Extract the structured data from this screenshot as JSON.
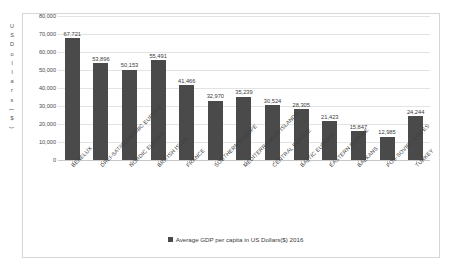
{
  "chart_data": {
    "type": "bar",
    "title": "",
    "xlabel": "",
    "ylabel": "US Dollars($)",
    "ylim": [
      0,
      80000
    ],
    "ytick_values": [
      0,
      10000,
      20000,
      30000,
      40000,
      50000,
      60000,
      70000,
      80000
    ],
    "ytick_labels": [
      "0",
      "10,000",
      "20,000",
      "30,000",
      "40,000",
      "50,000",
      "60,000",
      "70,000",
      "80,000"
    ],
    "grid": true,
    "legend_position": "bottom",
    "legend": [
      "Average GDP per capita in US Dollars($) 2016"
    ],
    "categories": [
      "BENELUX",
      "DREI-SAT/GERMANIC EUROPE",
      "NORDIC EUROPE",
      "BRITISH ISLES",
      "FRANCE",
      "SOUTHERN EUROPE",
      "MEDITERRANEAN ISLANDS",
      "CENTRAL EUROPE",
      "BALTIC EUROPE",
      "EASTERN EUROPE",
      "BALKANS",
      "POS-SOVIET STATES",
      "TURKEY"
    ],
    "values": [
      67721,
      53896,
      50153,
      55491,
      41466,
      32970,
      35239,
      30524,
      28305,
      21423,
      15847,
      12985,
      24244
    ],
    "value_labels": [
      "67,721",
      "53,896",
      "50,153",
      "55,491",
      "41,466",
      "32,970",
      "35,239",
      "30,524",
      "28,305",
      "21,423",
      "15,847",
      "12,985",
      "24,244"
    ],
    "series": [
      {
        "name": "Average GDP per capita in US Dollars($) 2016",
        "color": "#4a4a4a",
        "values": [
          67721,
          53896,
          50153,
          55491,
          41466,
          32970,
          35239,
          30524,
          28305,
          21423,
          15847,
          12985,
          24244
        ]
      }
    ]
  },
  "colors": {
    "bar": "#4a4a4a",
    "grid": "#e3e3e3",
    "axis": "#c8c8c8",
    "frame": "#d6d6d6",
    "text": "#3b3b3b",
    "background": "#ffffff"
  },
  "axis_title_chars": [
    "U",
    "S",
    "D",
    "o",
    "l",
    "l",
    "a",
    "r",
    "s",
    ")",
    "$",
    "("
  ]
}
